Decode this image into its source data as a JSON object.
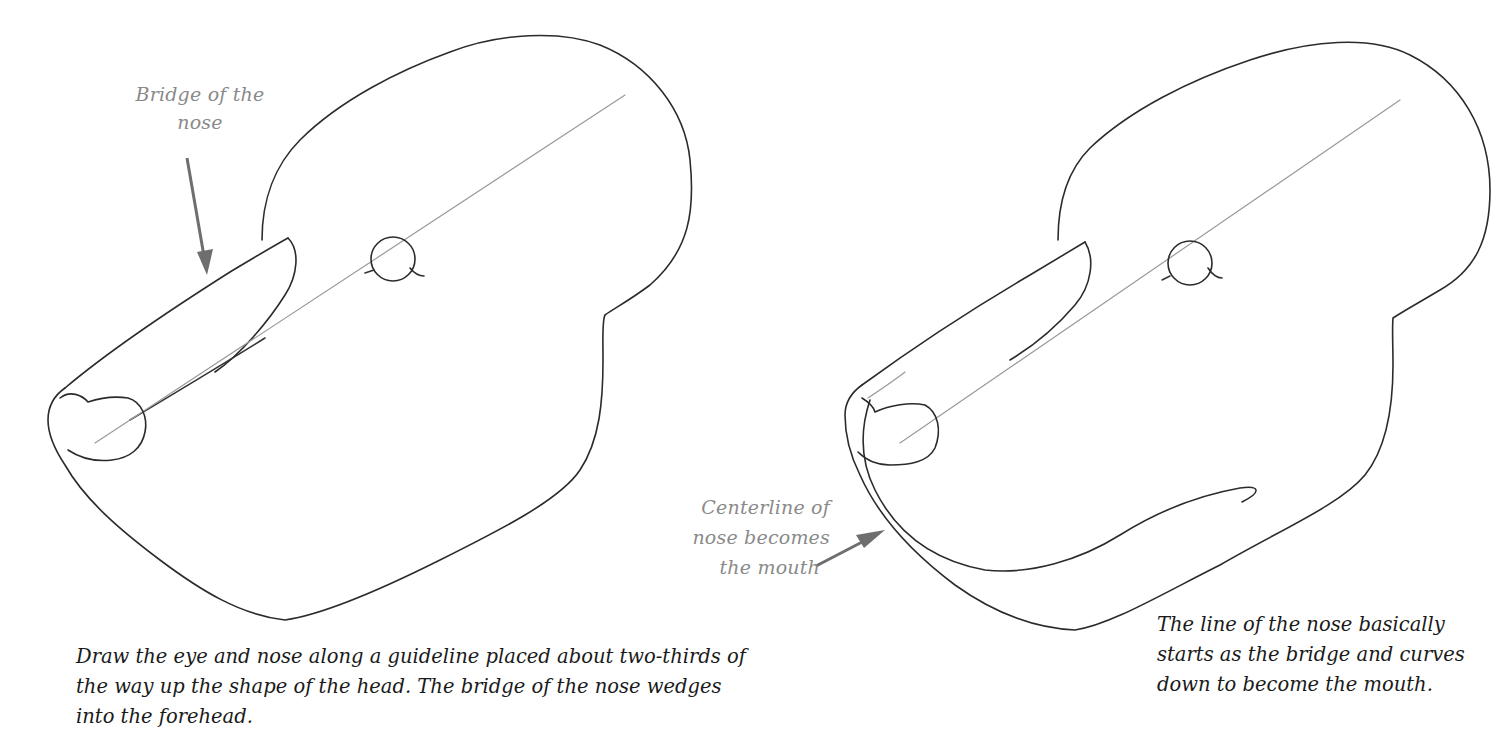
{
  "figure_left": {
    "label": {
      "text": "Bridge of the nose",
      "lines": [
        "Bridge of the",
        "nose"
      ]
    },
    "caption": "Draw the eye and nose along a guideline placed about two-thirds of\nthe way up the shape of the head. The bridge of the nose wedges\ninto the forehead."
  },
  "figure_right": {
    "label": {
      "text": "Centerline of nose becomes the mouth",
      "lines": [
        "Centerline of",
        "nose becomes",
        "the mouth"
      ]
    },
    "caption": "The line of the nose basically\nstarts as the bridge and curves\ndown to become the mouth."
  },
  "colors": {
    "background": "#ffffff",
    "outline": "#2b2b2b",
    "guideline": "#9a9a9a",
    "label_text": "#8a8a8a",
    "caption_text": "#1a1a1a",
    "arrow": "#6e6e6e"
  },
  "icons": {
    "left_arrow": "arrow-down-icon",
    "right_arrow": "arrow-up-right-icon"
  }
}
